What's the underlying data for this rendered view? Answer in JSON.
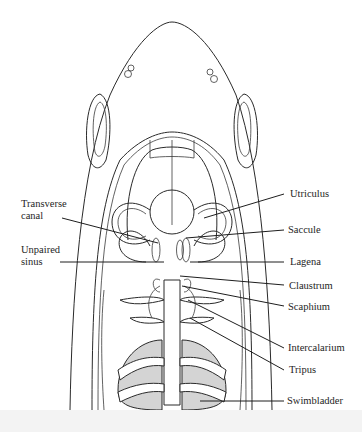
{
  "figure": {
    "labels_left": [
      {
        "id": "transverse-canal",
        "text": "Transverse canal",
        "lines": [
          "Transverse",
          "canal"
        ]
      },
      {
        "id": "unpaired-sinus",
        "text": "Unpaired sinus",
        "lines": [
          "Unpaired",
          "sinus"
        ]
      }
    ],
    "labels_right": [
      {
        "id": "utriculus",
        "text": "Utriculus"
      },
      {
        "id": "saccule",
        "text": "Saccule"
      },
      {
        "id": "lagena",
        "text": "Lagena"
      },
      {
        "id": "claustrum",
        "text": "Claustrum"
      },
      {
        "id": "scaphium",
        "text": "Scaphium"
      },
      {
        "id": "intercalarium",
        "text": "Intercalarium"
      },
      {
        "id": "tripus",
        "text": "Tripus"
      },
      {
        "id": "swimbladder",
        "text": "Swimbladder"
      }
    ]
  }
}
